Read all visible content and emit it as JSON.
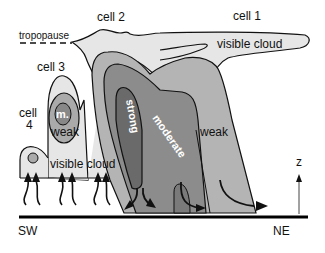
{
  "diagram": {
    "type": "cross-section",
    "labels": {
      "cell1": "cell 1",
      "cell2": "cell 2",
      "cell3": "cell 3",
      "cell4_line1": "cell",
      "cell4_line2": "4",
      "tropopause": "tropopause",
      "visible_cloud_upper": "visible cloud",
      "visible_cloud_lower": "visible cloud",
      "strong": "strong",
      "moderate": "moderate",
      "weak_main": "weak",
      "weak_cell3": "weak",
      "m_cell3": "m.",
      "z_axis": "z",
      "sw": "SW",
      "ne": "NE"
    },
    "colors": {
      "visible_cloud": "#e6e6e6",
      "weak": "#b4b4b4",
      "moderate": "#8c8c8c",
      "strong": "#6a6a6a",
      "m_core": "#888888",
      "outline": "#111111",
      "ground": "#000000"
    }
  }
}
